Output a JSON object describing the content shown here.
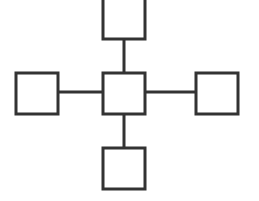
{
  "diagram": {
    "type": "star-topology",
    "stroke_color": "#333333",
    "fill_color": "#ffffff",
    "background": "#ffffff",
    "stroke_width": 3,
    "nodes": [
      {
        "id": "center",
        "x": 103,
        "y": 73,
        "w": 42,
        "h": 41
      },
      {
        "id": "top",
        "x": 103,
        "y": -2,
        "w": 42,
        "h": 41
      },
      {
        "id": "left",
        "x": 16,
        "y": 73,
        "w": 42,
        "h": 41
      },
      {
        "id": "right",
        "x": 196,
        "y": 73,
        "w": 42,
        "h": 41
      },
      {
        "id": "bottom",
        "x": 103,
        "y": 148,
        "w": 42,
        "h": 41
      }
    ],
    "edges": [
      {
        "from": "center",
        "to": "top",
        "x1": 124,
        "y1": 39,
        "x2": 124,
        "y2": 73
      },
      {
        "from": "center",
        "to": "left",
        "x1": 58,
        "y1": 92,
        "x2": 103,
        "y2": 92
      },
      {
        "from": "center",
        "to": "right",
        "x1": 145,
        "y1": 92,
        "x2": 196,
        "y2": 92
      },
      {
        "from": "center",
        "to": "bottom",
        "x1": 124,
        "y1": 114,
        "x2": 124,
        "y2": 148
      }
    ]
  }
}
